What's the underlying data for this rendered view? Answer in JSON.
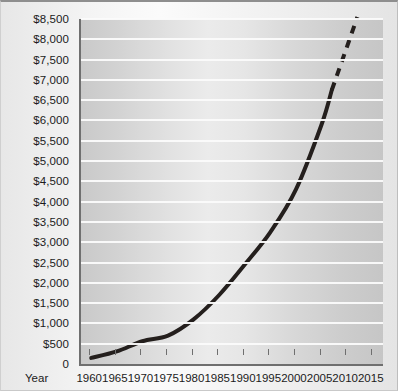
{
  "chart_data": {
    "type": "line",
    "title": "",
    "subtitle": "",
    "xlabel": "Year",
    "ylabel": "",
    "grid": true,
    "legend": "none",
    "xlim": [
      1958,
      2017
    ],
    "ylim": [
      0,
      8500
    ],
    "x_ticks": [
      1960,
      1965,
      1970,
      1975,
      1980,
      1985,
      1990,
      1995,
      2000,
      2005,
      2010,
      2015
    ],
    "y_ticks": [
      0,
      500,
      1000,
      1500,
      2000,
      2500,
      3000,
      3500,
      4000,
      4500,
      5000,
      5500,
      6000,
      6500,
      7000,
      7500,
      8000,
      8500
    ],
    "y_tick_labels": [
      "0",
      "$500",
      "$1,000",
      "$1,500",
      "$2,000",
      "$2,500",
      "$3,000",
      "$3,500",
      "$4,000",
      "$4,500",
      "$5,000",
      "$5,500",
      "$6,000",
      "$6,500",
      "$7,000",
      "$7,500",
      "$8,000",
      "$8,500"
    ],
    "series": [
      {
        "name": "actual",
        "style": "solid",
        "color": "#241f1d",
        "x": [
          1960,
          1965,
          1970,
          1975,
          1980,
          1985,
          1990,
          1995,
          2000,
          2005,
          2007
        ],
        "values": [
          150,
          310,
          560,
          700,
          1100,
          1700,
          2450,
          3250,
          4300,
          5900,
          6750
        ]
      },
      {
        "name": "projected",
        "style": "dashed",
        "color": "#241f1d",
        "x": [
          2007,
          2012
        ],
        "values": [
          6750,
          8550
        ]
      }
    ]
  },
  "axis": {
    "x_title": "Year"
  }
}
